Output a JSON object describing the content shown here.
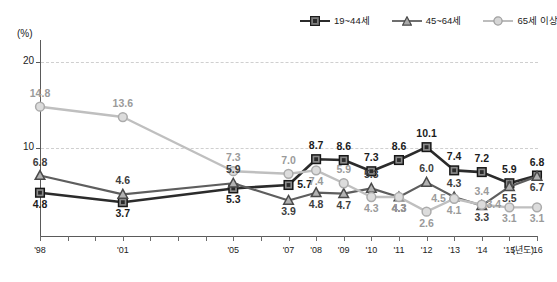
{
  "chart_data": {
    "type": "line",
    "title": "",
    "xlabel": "(년도)",
    "ylabel": "(%)",
    "ylim": [
      0,
      23
    ],
    "yticks": [
      10,
      20
    ],
    "grid": true,
    "legend_position": "top-right",
    "categories": [
      "'98",
      "'01",
      "'05",
      "'07",
      "'08",
      "'09",
      "'10",
      "'11",
      "'12",
      "'13",
      "'14",
      "'15",
      "'16"
    ],
    "x_tick_labels": [
      "'98",
      "",
      "",
      "'01",
      "",
      "",
      "",
      "'05",
      "",
      "'07",
      "'08",
      "'09",
      "'10",
      "'11",
      "'12",
      "'13",
      "'14",
      "'15",
      "'16"
    ],
    "series": [
      {
        "name": "19~44세",
        "marker": "square",
        "color": "#2b2b2b",
        "values": [
          4.8,
          3.7,
          5.3,
          5.7,
          8.7,
          8.6,
          7.3,
          8.6,
          10.1,
          7.4,
          7.2,
          5.9,
          6.8
        ]
      },
      {
        "name": "45~64세",
        "marker": "triangle",
        "color": "#555555",
        "values": [
          6.8,
          4.6,
          5.9,
          3.9,
          4.8,
          4.7,
          5.3,
          4.3,
          6.0,
          4.3,
          3.3,
          5.5,
          6.7
        ]
      },
      {
        "name": "65세 이상",
        "marker": "circle",
        "color": "#b0b0b0",
        "values": [
          14.8,
          13.6,
          7.3,
          7.0,
          7.4,
          5.9,
          4.3,
          4.3,
          2.6,
          4.1,
          3.4,
          3.1,
          3.1
        ]
      }
    ],
    "point_labels": [
      {
        "series": "19~44세",
        "x": "'98",
        "value": "4.8",
        "pos": "below"
      },
      {
        "series": "19~44세",
        "x": "'01",
        "value": "3.7",
        "pos": "below"
      },
      {
        "series": "19~44세",
        "x": "'05",
        "value": "5.3",
        "pos": "below"
      },
      {
        "series": "19~44세",
        "x": "'07",
        "value": "5.7",
        "pos": "right"
      },
      {
        "series": "19~44세",
        "x": "'08",
        "value": "8.7",
        "pos": "above"
      },
      {
        "series": "19~44세",
        "x": "'09",
        "value": "8.6",
        "pos": "above"
      },
      {
        "series": "19~44세",
        "x": "'10",
        "value": "7.3",
        "pos": "above"
      },
      {
        "series": "19~44세",
        "x": "'11",
        "value": "8.6",
        "pos": "above"
      },
      {
        "series": "19~44세",
        "x": "'12",
        "value": "10.1",
        "pos": "above"
      },
      {
        "series": "19~44세",
        "x": "'13",
        "value": "7.4",
        "pos": "above"
      },
      {
        "series": "19~44세",
        "x": "'14",
        "value": "7.2",
        "pos": "above"
      },
      {
        "series": "19~44세",
        "x": "'15",
        "value": "5.9",
        "pos": "above"
      },
      {
        "series": "19~44세",
        "x": "'16",
        "value": "6.8",
        "pos": "above"
      },
      {
        "series": "45~64세",
        "x": "'98",
        "value": "6.8",
        "pos": "above"
      },
      {
        "series": "45~64세",
        "x": "'01",
        "value": "4.6",
        "pos": "above"
      },
      {
        "series": "45~64세",
        "x": "'05",
        "value": "5.9",
        "pos": "above"
      },
      {
        "series": "45~64세",
        "x": "'07",
        "value": "3.9",
        "pos": "below"
      },
      {
        "series": "45~64세",
        "x": "'08",
        "value": "4.8",
        "pos": "below"
      },
      {
        "series": "45~64세",
        "x": "'09",
        "value": "4.7",
        "pos": "below"
      },
      {
        "series": "45~64세",
        "x": "'10",
        "value": "5.3",
        "pos": "above"
      },
      {
        "series": "45~64세",
        "x": "'11",
        "value": "4.3",
        "pos": "below"
      },
      {
        "series": "45~64세",
        "x": "'12",
        "value": "6.0",
        "pos": "above"
      },
      {
        "series": "45~64세",
        "x": "'13",
        "value": "4.3",
        "pos": "above"
      },
      {
        "series": "45~64세",
        "x": "'14",
        "value": "3.3",
        "pos": "below"
      },
      {
        "series": "45~64세",
        "x": "'15",
        "value": "5.5",
        "pos": "below"
      },
      {
        "series": "45~64세",
        "x": "'16",
        "value": "6.7",
        "pos": "below"
      },
      {
        "series": "65세 이상",
        "x": "'98",
        "value": "14.8",
        "pos": "above"
      },
      {
        "series": "65세 이상",
        "x": "'01",
        "value": "13.6",
        "pos": "above"
      },
      {
        "series": "65세 이상",
        "x": "'05",
        "value": "7.3",
        "pos": "above"
      },
      {
        "series": "65세 이상",
        "x": "'07",
        "value": "7.0",
        "pos": "above"
      },
      {
        "series": "65세 이상",
        "x": "'08",
        "value": "7.4",
        "pos": "below"
      },
      {
        "series": "65세 이상",
        "x": "'09",
        "value": "5.9",
        "pos": "above"
      },
      {
        "series": "65세 이상",
        "x": "'10",
        "value": "4.3",
        "pos": "below"
      },
      {
        "series": "65세 이상",
        "x": "'11",
        "value": "4.3",
        "pos": "below"
      },
      {
        "series": "65세 이상",
        "x": "'12",
        "value": "2.6",
        "pos": "below"
      },
      {
        "series": "65세 이상",
        "x": "'13",
        "value": "4.1",
        "pos": "below"
      },
      {
        "series": "65세 이상",
        "x": "'14",
        "value": "3.4",
        "pos": "above"
      },
      {
        "series": "65세 이상",
        "x": "'15",
        "value": "3.1",
        "pos": "below"
      },
      {
        "series": "65세 이상",
        "x": "'16",
        "value": "3.1",
        "pos": "below"
      }
    ],
    "extra_labels": [
      {
        "value": "4.5",
        "color": "#9a9a9a",
        "x": "'12",
        "note": "45~64세 mid annotation"
      },
      {
        "value": "3.4",
        "color": "#9a9a9a",
        "x": "'14",
        "note": "65세 이상 annotation"
      }
    ]
  },
  "axis": {
    "y_unit": "(%)",
    "x_unit": "(년도)",
    "y_tick_10": "10",
    "y_tick_20": "20"
  },
  "legend": {
    "items": [
      {
        "label": "19~44세",
        "marker": "square-marker-icon",
        "color": "#2b2b2b"
      },
      {
        "label": "45~64세",
        "marker": "triangle-marker-icon",
        "color": "#555555"
      },
      {
        "label": "65세 이상",
        "marker": "circle-marker-icon",
        "color": "#b0b0b0"
      }
    ]
  }
}
